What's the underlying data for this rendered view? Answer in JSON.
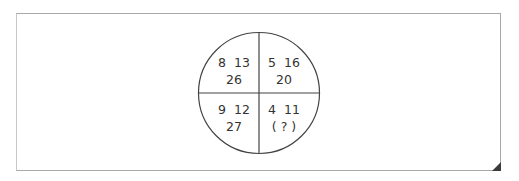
{
  "puzzle": {
    "type": "circle-quadrant-number-puzzle",
    "quadrants": {
      "top_left": {
        "top": "8  13",
        "bottom": "26",
        "values": [
          8,
          13,
          26
        ]
      },
      "top_right": {
        "top": "5  16",
        "bottom": "20",
        "values": [
          5,
          16,
          20
        ]
      },
      "bottom_left": {
        "top": "9  12",
        "bottom": "27",
        "values": [
          9,
          12,
          27
        ]
      },
      "bottom_right": {
        "top": "4  11",
        "bottom": "( ? )",
        "values": [
          4,
          11,
          null
        ]
      }
    }
  },
  "colors": {
    "frame_border": "#a8a8a8",
    "circle_stroke": "#444444",
    "text": "#333333",
    "corner_fold": "#3a3a3a"
  }
}
